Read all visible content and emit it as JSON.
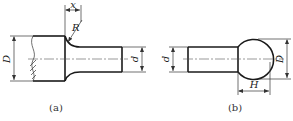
{
  "figure_a": {
    "caption": "(a)",
    "labels": {
      "large_diameter": "D",
      "small_diameter": "d",
      "fillet_radius": "R",
      "fillet_length": "x"
    }
  },
  "figure_b": {
    "caption": "(b)",
    "labels": {
      "shaft_diameter": "d",
      "ball_diameter": "D",
      "ball_height": "H"
    }
  },
  "colors": {
    "line": "#1a1a1a",
    "background": "#ffffff"
  }
}
